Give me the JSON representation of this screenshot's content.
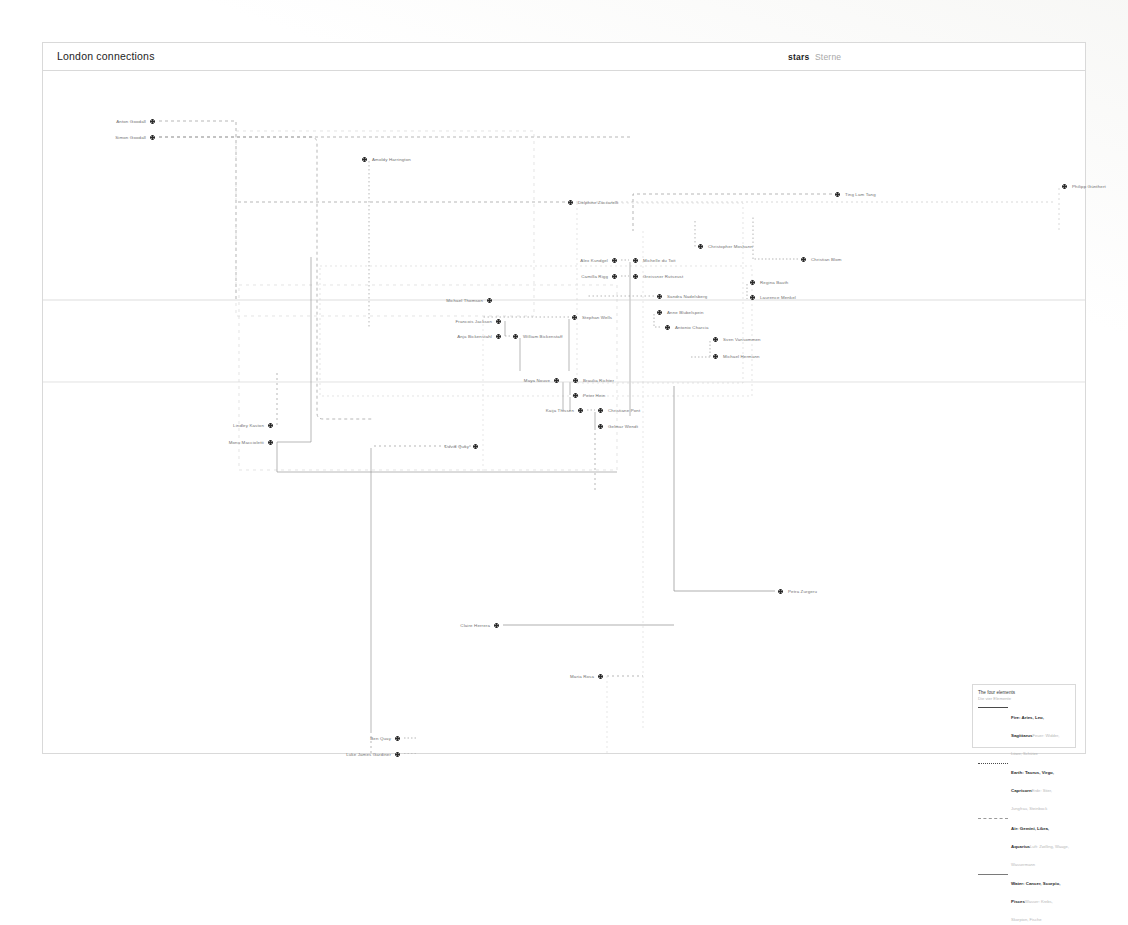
{
  "header": {
    "title": "London connections",
    "stars_en": "stars",
    "stars_de": "Sterne"
  },
  "legend": {
    "title_en": "The four elements",
    "title_de": "Die vier Elemente",
    "rows": [
      {
        "key": "fire",
        "en": "Fire: Aries, Leo, Sagittarus",
        "de": "Feuer: Widder, Löwe, Schütze"
      },
      {
        "key": "earth",
        "en": "Earth: Taurus, Virgo, Capricorn",
        "de": "Erde: Stier, Jungfrau, Steinbock"
      },
      {
        "key": "air",
        "en": "Air: Gemini, Libra, Aquarius",
        "de": "Luft: Zwilling, Waage, Wassermann"
      },
      {
        "key": "water",
        "en": "Water: Cancer, Scorpio, Pisces",
        "de": "Wasser: Krebs, Skorpion, Fische"
      }
    ]
  },
  "nodes": [
    {
      "id": "anton-goodall",
      "name": "Anton Goodall",
      "x": 113,
      "y": 50,
      "side": "r"
    },
    {
      "id": "simon-goodall",
      "name": "Simon Goodall",
      "x": 113,
      "y": 66,
      "side": "r"
    },
    {
      "id": "amoldy-harrington",
      "name": "Amoldy Harrington",
      "x": 319,
      "y": 88,
      "side": "l"
    },
    {
      "id": "delphine-zuccarelli",
      "name": "Delphine Zuccarelli",
      "x": 525,
      "y": 131,
      "side": "l"
    },
    {
      "id": "ting-lam-tang",
      "name": "Ting Lam Tang",
      "x": 792,
      "y": 123,
      "side": "l"
    },
    {
      "id": "philipp-gunthert",
      "name": "Philipp Günthert",
      "x": 1019,
      "y": 115,
      "side": "l"
    },
    {
      "id": "christopher-moshann",
      "name": "Christopher Moshann",
      "x": 655,
      "y": 175,
      "side": "l"
    },
    {
      "id": "alex-kundgel",
      "name": "Alex Kundgel",
      "x": 575,
      "y": 189,
      "side": "r"
    },
    {
      "id": "michelle-du-toit",
      "name": "Michelle du Toit",
      "x": 590,
      "y": 189,
      "side": "l"
    },
    {
      "id": "christian-blom",
      "name": "Christian Blom",
      "x": 758,
      "y": 188,
      "side": "l"
    },
    {
      "id": "camilla-rigg",
      "name": "Camilla Rigg",
      "x": 575,
      "y": 205,
      "side": "r"
    },
    {
      "id": "greissner-rutseust",
      "name": "Greissner Rutseust",
      "x": 590,
      "y": 205,
      "side": "l"
    },
    {
      "id": "regina-bauth",
      "name": "Regina Bauth",
      "x": 707,
      "y": 211,
      "side": "l"
    },
    {
      "id": "sandra-nadelsberg",
      "name": "Sandra Nadelsberg",
      "x": 614,
      "y": 225,
      "side": "l"
    },
    {
      "id": "laurence-menkel",
      "name": "Laurence Menkel",
      "x": 707,
      "y": 226,
      "side": "l"
    },
    {
      "id": "michael-thomson",
      "name": "Michael Thomson",
      "x": 450,
      "y": 229,
      "side": "r"
    },
    {
      "id": "anne-blubelspein",
      "name": "Anne Blubelspein",
      "x": 614,
      "y": 241,
      "side": "l"
    },
    {
      "id": "stephan-wells",
      "name": "Stephan Wells",
      "x": 529,
      "y": 246,
      "side": "l"
    },
    {
      "id": "francois-jackson",
      "name": "Francois Jackson",
      "x": 459,
      "y": 250,
      "side": "r"
    },
    {
      "id": "antonio-charcia",
      "name": "Antonio Charcia",
      "x": 622,
      "y": 256,
      "side": "l"
    },
    {
      "id": "anja-bickenstahl",
      "name": "Anja Bickenstahl",
      "x": 459,
      "y": 265,
      "side": "r"
    },
    {
      "id": "william-bickenstaff",
      "name": "William Bickenstaff",
      "x": 470,
      "y": 265,
      "side": "l"
    },
    {
      "id": "sven-vansommen",
      "name": "Sven Vansommen",
      "x": 670,
      "y": 268,
      "side": "l"
    },
    {
      "id": "michael-hermann",
      "name": "Michael Hermann",
      "x": 670,
      "y": 285,
      "side": "l"
    },
    {
      "id": "maya-nouve",
      "name": "Maya Nouve",
      "x": 517,
      "y": 309,
      "side": "r"
    },
    {
      "id": "braulia-richter",
      "name": "Braulia Richter",
      "x": 530,
      "y": 309,
      "side": "l"
    },
    {
      "id": "peter-hein",
      "name": "Peter Hein",
      "x": 530,
      "y": 324,
      "side": "l"
    },
    {
      "id": "kaija-thissen",
      "name": "Kaija Thissen",
      "x": 541,
      "y": 339,
      "side": "r"
    },
    {
      "id": "christiane-pont",
      "name": "Christiane Pont",
      "x": 555,
      "y": 339,
      "side": "l"
    },
    {
      "id": "gelmar-wendt",
      "name": "Gelmar Wendt",
      "x": 555,
      "y": 355,
      "side": "l"
    },
    {
      "id": "lindley-kaston",
      "name": "Lindley Kaston",
      "x": 231,
      "y": 354,
      "side": "r"
    },
    {
      "id": "monu-maccioletti",
      "name": "Monu Maccioletti",
      "x": 231,
      "y": 371,
      "side": "r"
    },
    {
      "id": "david-quay",
      "name": "David Quay",
      "x": 436,
      "y": 375,
      "side": "r"
    },
    {
      "id": "petra-zurgeru",
      "name": "Petra Zurgeru",
      "x": 735,
      "y": 520,
      "side": "l"
    },
    {
      "id": "claire-herrera",
      "name": "Claire Herrera",
      "x": 457,
      "y": 554,
      "side": "r"
    },
    {
      "id": "maria-rosa",
      "name": "Maria Rosa",
      "x": 561,
      "y": 605,
      "side": "r"
    },
    {
      "id": "ben-quay",
      "name": "Ben Quay",
      "x": 358,
      "y": 667,
      "side": "r"
    },
    {
      "id": "luke-james-gardiner",
      "name": "Luke James Gardiner",
      "x": 358,
      "y": 683,
      "side": "r"
    }
  ]
}
